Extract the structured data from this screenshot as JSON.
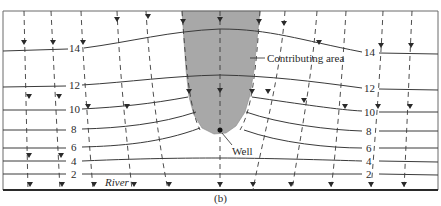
{
  "figure": {
    "caption": "(b)",
    "labels": {
      "contributing_area": "Contributing area",
      "well": "Well",
      "river": "River"
    },
    "contours": [
      {
        "value": "14"
      },
      {
        "value": "12"
      },
      {
        "value": "10"
      },
      {
        "value": "8"
      },
      {
        "value": "6"
      },
      {
        "value": "4"
      },
      {
        "value": "2"
      }
    ],
    "colors": {
      "line": "#3a3a3a",
      "contributing_area_fill": "#a8a8a8",
      "background": "#ffffff"
    }
  }
}
